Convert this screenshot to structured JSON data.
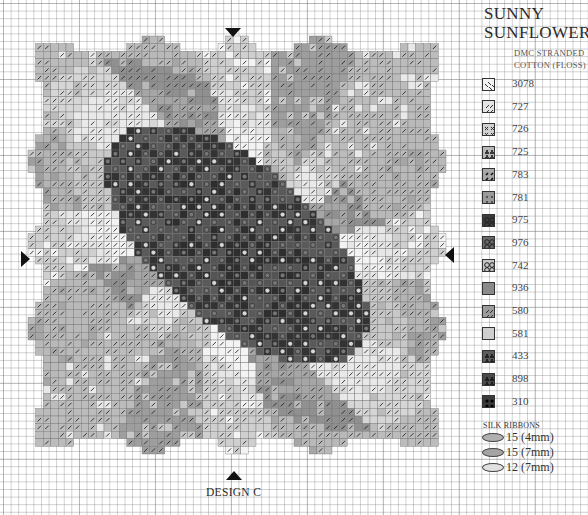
{
  "title": {
    "line1": "SUNNY",
    "line2": "SUNFLOWERS"
  },
  "subtitle": {
    "line1": "DMC STRANDED",
    "line2": "COTTON (FLOSS)"
  },
  "legend": {
    "items": [
      {
        "code": "3078",
        "symbol": "diagonal-dashes",
        "color": "#f2f2f2"
      },
      {
        "code": "727",
        "symbol": "diagonal-slashes",
        "color": "#e4e4e4"
      },
      {
        "code": "726",
        "symbol": "cross-x",
        "color": "#d0d0d0"
      },
      {
        "code": "725",
        "symbol": "club-dots",
        "color": "#b8b8b8"
      },
      {
        "code": "783",
        "symbol": "diagonal-dots",
        "color": "#a8a8a8"
      },
      {
        "code": "781",
        "symbol": "small-dots",
        "color": "#9a9a9a"
      },
      {
        "code": "975",
        "symbol": "circles",
        "color": "#3c3c3c"
      },
      {
        "code": "976",
        "symbol": "circles",
        "color": "#6a6a6a"
      },
      {
        "code": "742",
        "symbol": "circles",
        "color": "#c4c4c4"
      },
      {
        "code": "936",
        "symbol": "solid",
        "color": "#8a8a8a"
      },
      {
        "code": "580",
        "symbol": "diagonal-slashes",
        "color": "#9c9c9c"
      },
      {
        "code": "581",
        "symbol": "solid",
        "color": "#cfcfcf"
      },
      {
        "code": "433",
        "symbol": "club-dots",
        "color": "#5c5c5c"
      },
      {
        "code": "898",
        "symbol": "club-dots",
        "color": "#4a4a4a"
      },
      {
        "code": "310",
        "symbol": "big-dots",
        "color": "#3a3a3a"
      }
    ]
  },
  "silk_ribbons": {
    "heading": "SILK RIBBONS",
    "items": [
      {
        "label": "15 (4mm)",
        "color": "#b0b0b0"
      },
      {
        "label": "15 (7mm)",
        "color": "#a4a4a4"
      },
      {
        "label": "12 (7mm)",
        "color": "#e0e0e0"
      }
    ]
  },
  "design_label": "DESIGN C",
  "center_markers": [
    "top",
    "left",
    "right",
    "bottom"
  ]
}
